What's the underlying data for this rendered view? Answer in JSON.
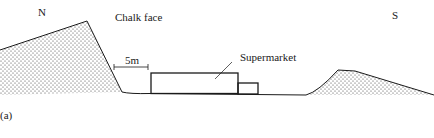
{
  "figure": {
    "panel_label": "(a)",
    "labels": {
      "north": "N",
      "south": "S",
      "chalk_face": "Chalk face",
      "supermarket": "Supermarket",
      "scale": "5m"
    },
    "colors": {
      "line": "#1a1a1a",
      "stipple": "#333333",
      "background": "#ffffff"
    }
  }
}
